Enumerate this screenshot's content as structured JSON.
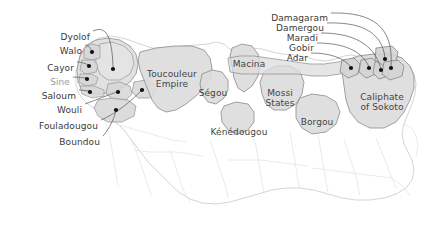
{
  "map": {
    "title": "Precolonial states of West Africa",
    "background_color": "#ffffff",
    "region_fill_color": "#dcdcdc",
    "region_stroke_color": "#8a8a8a",
    "coastline_stroke_color": "#cfcfcf",
    "border_stroke_color": "#e2e2e2",
    "leader_line_color": "#555555",
    "marker_color": "#111111",
    "label_color": "#3a3a3a",
    "faded_label_color": "#9a9a9a"
  },
  "callout_labels_left": [
    {
      "id": "dyolof",
      "text": "Dyolof",
      "x": 90,
      "y": 33,
      "faded": false
    },
    {
      "id": "walo",
      "text": "Walo",
      "x": 82,
      "y": 47,
      "faded": false
    },
    {
      "id": "cayor",
      "text": "Cayor",
      "x": 74,
      "y": 64,
      "faded": false
    },
    {
      "id": "sine",
      "text": "Sine",
      "x": 70,
      "y": 78,
      "faded": true
    },
    {
      "id": "saloum",
      "text": "Saloum",
      "x": 76,
      "y": 92,
      "faded": false
    },
    {
      "id": "wouli",
      "text": "Wouli",
      "x": 82,
      "y": 106,
      "faded": false
    },
    {
      "id": "fouladougou",
      "text": "Fouladougou",
      "x": 98,
      "y": 122,
      "faded": false
    },
    {
      "id": "boundou",
      "text": "Boundou",
      "x": 100,
      "y": 138,
      "faded": false
    }
  ],
  "callout_labels_right": [
    {
      "id": "damagaram",
      "text": "Damagaram",
      "x": 328,
      "y": 14,
      "faded": false
    },
    {
      "id": "damergou",
      "text": "Damergou",
      "x": 324,
      "y": 24,
      "faded": false
    },
    {
      "id": "maradi",
      "text": "Maradi",
      "x": 318,
      "y": 34,
      "faded": false
    },
    {
      "id": "gobir",
      "text": "Gobir",
      "x": 314,
      "y": 44,
      "faded": false
    },
    {
      "id": "adar",
      "text": "Adar",
      "x": 308,
      "y": 54,
      "faded": false
    }
  ],
  "region_labels": [
    {
      "id": "toucouleur-empire",
      "line1": "Toucouleur",
      "line2": "Empire",
      "x": 172,
      "y": 70
    },
    {
      "id": "segou",
      "line1": "Ségou",
      "line2": "",
      "x": 213,
      "y": 89
    },
    {
      "id": "macina",
      "line1": "Macina",
      "line2": "",
      "x": 249,
      "y": 60
    },
    {
      "id": "kenedougou",
      "line1": "Kénédougou",
      "line2": "",
      "x": 239,
      "y": 128
    },
    {
      "id": "mossi-states",
      "line1": "Mossi",
      "line2": "States",
      "x": 280,
      "y": 89
    },
    {
      "id": "borgou",
      "line1": "Borgou",
      "line2": "",
      "x": 317,
      "y": 118
    },
    {
      "id": "caliphate-of-sokoto",
      "line1": "Caliphate",
      "line2": "of Sokoto",
      "x": 382,
      "y": 93
    }
  ],
  "markers_left": [
    {
      "id": "marker-dyolof",
      "x": 113,
      "y": 69
    },
    {
      "id": "marker-walo",
      "x": 92,
      "y": 52
    },
    {
      "id": "marker-cayor",
      "x": 89,
      "y": 66
    },
    {
      "id": "marker-sine",
      "x": 87,
      "y": 79
    },
    {
      "id": "marker-saloum",
      "x": 90,
      "y": 92
    },
    {
      "id": "marker-wouli",
      "x": 118,
      "y": 92
    },
    {
      "id": "marker-fouladougou",
      "x": 142,
      "y": 90
    },
    {
      "id": "marker-boundou",
      "x": 116,
      "y": 110
    }
  ],
  "markers_right": [
    {
      "id": "marker-adar",
      "x": 351,
      "y": 68
    },
    {
      "id": "marker-gobir",
      "x": 369,
      "y": 68
    },
    {
      "id": "marker-maradi",
      "x": 381,
      "y": 70
    },
    {
      "id": "marker-damergou",
      "x": 385,
      "y": 59
    },
    {
      "id": "marker-damagaram",
      "x": 391,
      "y": 68
    }
  ]
}
